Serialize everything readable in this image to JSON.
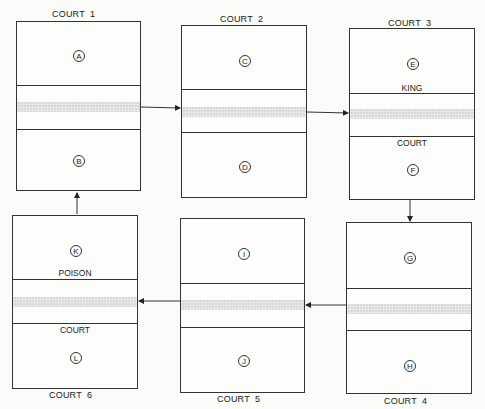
{
  "courts": [
    {
      "id": 1,
      "label": "COURT  1",
      "zones": [
        "A",
        "B"
      ],
      "net_labels": {
        "top": "",
        "bottom": ""
      }
    },
    {
      "id": 2,
      "label": "COURT  2",
      "zones": [
        "C",
        "D"
      ],
      "net_labels": {
        "top": "",
        "bottom": ""
      }
    },
    {
      "id": 3,
      "label": "COURT  3",
      "zones": [
        "E",
        "F"
      ],
      "net_labels": {
        "top": "KING",
        "bottom": "COURT"
      }
    },
    {
      "id": 4,
      "label": "COURT  4",
      "zones": [
        "G",
        "H"
      ],
      "net_labels": {
        "top": "",
        "bottom": ""
      }
    },
    {
      "id": 5,
      "label": "COURT  5",
      "zones": [
        "I",
        "J"
      ],
      "net_labels": {
        "top": "",
        "bottom": ""
      }
    },
    {
      "id": 6,
      "label": "COURT  6",
      "zones": [
        "K",
        "L"
      ],
      "net_labels": {
        "top": "POISON",
        "bottom": "COURT"
      }
    }
  ],
  "flow": [
    "COURT 1 → COURT 2",
    "COURT 2 → COURT 3",
    "COURT 3 → COURT 4",
    "COURT 4 → COURT 5",
    "COURT 5 → COURT 6",
    "COURT 6 → COURT 1"
  ],
  "colors": {
    "line": "#333333",
    "net": "#d9d9d9",
    "background": "#fbfbf9"
  }
}
